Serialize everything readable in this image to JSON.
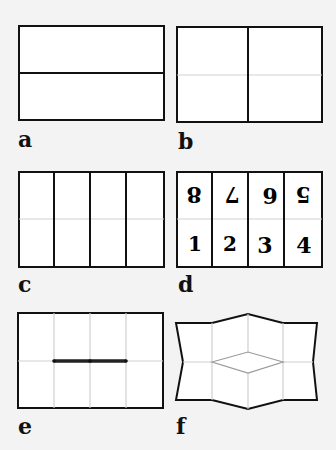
{
  "figure": {
    "background": "#f3f3f3",
    "paper_fill": "#ffffff",
    "stroke_dark": "#111111",
    "stroke_fold": "#cfcfcf",
    "panels": [
      {
        "id": "a",
        "label": "a",
        "caption": "Sheet with one horizontal fold across the middle"
      },
      {
        "id": "b",
        "label": "b",
        "caption": "Sheet with one vertical fold; faint horizontal crease"
      },
      {
        "id": "c",
        "label": "c",
        "caption": "Sheet with three vertical folds (four columns); faint horizontal crease"
      },
      {
        "id": "d",
        "label": "d",
        "caption": "Page numbering of the eight panels",
        "top_row": [
          "8",
          "7",
          "6",
          "5"
        ],
        "top_row_orientation": "upside-down",
        "bottom_row": [
          "1",
          "2",
          "3",
          "4"
        ]
      },
      {
        "id": "e",
        "label": "e",
        "caption": "Slit cut along the middle crease between the inner columns"
      },
      {
        "id": "f",
        "label": "f",
        "caption": "Sheet pushed together, opening the slit into a diamond"
      }
    ]
  }
}
